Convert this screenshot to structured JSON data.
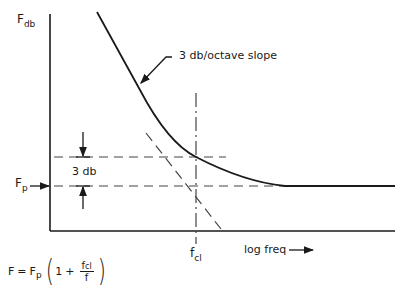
{
  "diagram": {
    "y_axis_label": {
      "main": "F",
      "sub": "db"
    },
    "x_axis_label": "log freq",
    "x_axis_arrow": "right-arrow",
    "fp_label": {
      "main": "F",
      "sub": "p"
    },
    "fcl_label": {
      "main": "f",
      "sub": "cl"
    },
    "slope_label": "3 db/octave slope",
    "gap_label": "3 db",
    "formula": {
      "lhs": "F",
      "eq": "=",
      "rhs_main": "F",
      "rhs_sub": "p",
      "paren_open": "(",
      "one": "1",
      "plus": "+",
      "frac_num_main": "f",
      "frac_num_sub": "cl",
      "frac_den": "f",
      "paren_close": ")"
    },
    "colors": {
      "line": "#1a1a1a",
      "dashed": "#444444",
      "background": "#ffffff"
    }
  }
}
